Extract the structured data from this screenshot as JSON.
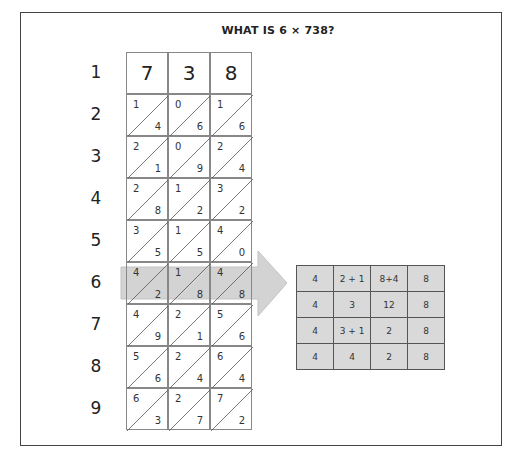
{
  "title": "WHAT IS 6 × 738?",
  "row_labels": [
    "1",
    "2",
    "3",
    "4",
    "5",
    "6",
    "7",
    "8",
    "9"
  ],
  "header_digits": [
    "7",
    "3",
    "8"
  ],
  "lattice_rows": [
    [
      [
        "1",
        "4"
      ],
      [
        "0",
        "6"
      ],
      [
        "1",
        "6"
      ]
    ],
    [
      [
        "2",
        "1"
      ],
      [
        "0",
        "9"
      ],
      [
        "2",
        "4"
      ]
    ],
    [
      [
        "2",
        "8"
      ],
      [
        "1",
        "2"
      ],
      [
        "3",
        "2"
      ]
    ],
    [
      [
        "3",
        "5"
      ],
      [
        "1",
        "5"
      ],
      [
        "4",
        "0"
      ]
    ],
    [
      [
        "4",
        "2"
      ],
      [
        "1",
        "8"
      ],
      [
        "4",
        "8"
      ]
    ],
    [
      [
        "4",
        "9"
      ],
      [
        "2",
        "1"
      ],
      [
        "5",
        "6"
      ]
    ],
    [
      [
        "5",
        "6"
      ],
      [
        "2",
        "4"
      ],
      [
        "6",
        "4"
      ]
    ],
    [
      [
        "6",
        "3"
      ],
      [
        "2",
        "7"
      ],
      [
        "7",
        "2"
      ]
    ]
  ],
  "highlighted_row": "6",
  "result_table": [
    [
      "4",
      "2 + 1",
      "8+4",
      "8"
    ],
    [
      "4",
      "3",
      "12",
      "8"
    ],
    [
      "4",
      "3 + 1",
      "2",
      "8"
    ],
    [
      "4",
      "4",
      "2",
      "8"
    ]
  ],
  "colors": {
    "arrow_fill": "#c8c8c8",
    "arrow_stroke": "#bbbbbb",
    "table_bg": "#d9d9d9",
    "frame": "#444444"
  }
}
